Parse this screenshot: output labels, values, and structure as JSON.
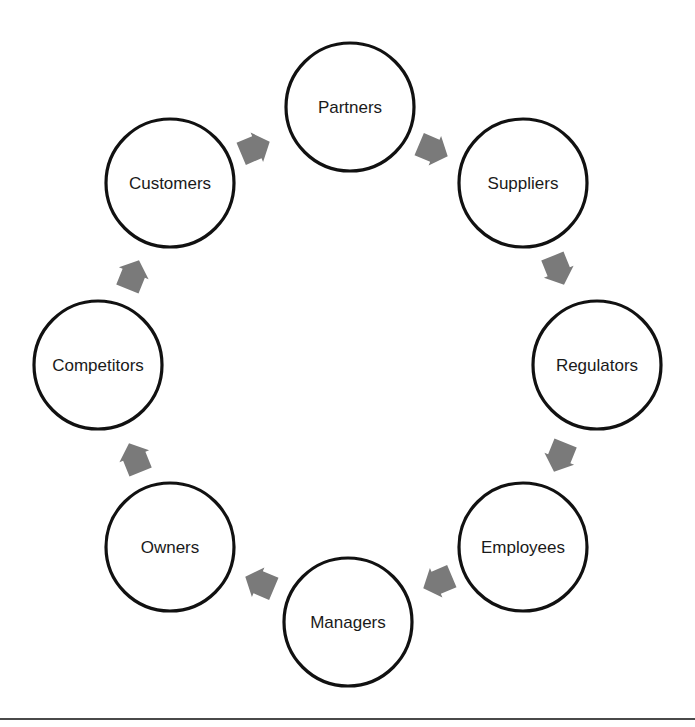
{
  "diagram": {
    "type": "stakeholder-cycle",
    "colors": {
      "circle_stroke": "#111111",
      "circle_fill": "#ffffff",
      "arrow_fill": "#7a7a7a",
      "label": "#1a1a1a",
      "rule": "#4a4a4a"
    },
    "nodes": [
      {
        "label": "Partners",
        "cx": 350,
        "cy": 107
      },
      {
        "label": "Suppliers",
        "cx": 523,
        "cy": 183
      },
      {
        "label": "Regulators",
        "cx": 597,
        "cy": 365
      },
      {
        "label": "Employees",
        "cx": 523,
        "cy": 547
      },
      {
        "label": "Managers",
        "cx": 348,
        "cy": 622
      },
      {
        "label": "Owners",
        "cx": 170,
        "cy": 547
      },
      {
        "label": "Competitors",
        "cx": 98,
        "cy": 365
      },
      {
        "label": "Customers",
        "cx": 170,
        "cy": 183
      }
    ],
    "node_radius": 64,
    "arrows": [
      {
        "from": "Customers",
        "to": "Partners",
        "x": 255,
        "y": 148,
        "rotation": 67
      },
      {
        "from": "Partners",
        "to": "Suppliers",
        "x": 433,
        "y": 150,
        "rotation": 113
      },
      {
        "from": "Suppliers",
        "to": "Regulators",
        "x": 558,
        "y": 270,
        "rotation": 158
      },
      {
        "from": "Regulators",
        "to": "Employees",
        "x": 560,
        "y": 457,
        "rotation": 202
      },
      {
        "from": "Employees",
        "to": "Managers",
        "x": 438,
        "y": 582,
        "rotation": 247
      },
      {
        "from": "Managers",
        "to": "Owners",
        "x": 260,
        "y": 583,
        "rotation": 293
      },
      {
        "from": "Owners",
        "to": "Competitors",
        "x": 135,
        "y": 458,
        "rotation": 338
      },
      {
        "from": "Competitors",
        "to": "Customers",
        "x": 133,
        "y": 275,
        "rotation": 22
      }
    ]
  }
}
